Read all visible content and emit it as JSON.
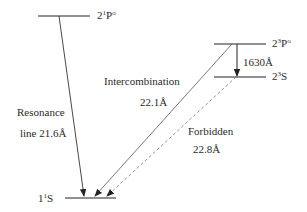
{
  "diagram": {
    "type": "energy-level-diagram",
    "levels": [
      {
        "id": "2_1P_o",
        "prefix": "2",
        "sup": "1",
        "term": "P",
        "parity_sup": "o"
      },
      {
        "id": "2_3P_o",
        "prefix": "2",
        "sup": "3",
        "term": "P",
        "parity_sup": "o"
      },
      {
        "id": "2_3S",
        "prefix": "2",
        "sup": "3",
        "term": "S",
        "parity_sup": ""
      },
      {
        "id": "1_1S",
        "prefix": "1",
        "sup": "1",
        "term": "S",
        "parity_sup": ""
      }
    ],
    "transitions": [
      {
        "id": "resonance",
        "from": "2_1P_o",
        "to": "1_1S",
        "name": "Resonance",
        "wavelength": "line 21.6Å",
        "style": "solid"
      },
      {
        "id": "intercombination",
        "from": "2_3P_o",
        "to": "1_1S",
        "name": "Intercombination",
        "wavelength": "22.1Å",
        "style": "solid"
      },
      {
        "id": "forbidden",
        "from": "2_3S",
        "to": "1_1S",
        "name": "Forbidden",
        "wavelength": "22.8Å",
        "style": "dashed"
      },
      {
        "id": "triplet",
        "from": "2_3P_o",
        "to": "2_3S",
        "name": "",
        "wavelength": "1630Å",
        "style": "solid"
      }
    ],
    "colors": {
      "line": "#222222",
      "dashed": "#777777",
      "text": "#2a2a2a"
    }
  }
}
